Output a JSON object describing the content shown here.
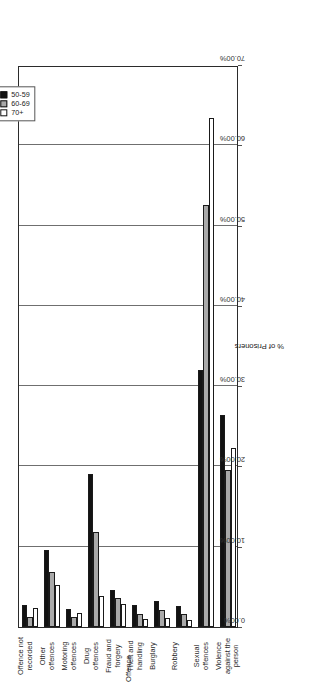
{
  "chart_data": {
    "type": "bar",
    "orientation": "horizontal",
    "title": "",
    "xlabel": "Offence",
    "ylabel": "% of Prisoners",
    "categories": [
      "Violence against the person",
      "Sexual offences",
      "Robbery",
      "Burglary",
      "Theft and handling",
      "Fraud and forgery",
      "Drug offences",
      "Motoring offences",
      "Other offences",
      "Offence not recorded"
    ],
    "category_labels": [
      "Violence\nagainst the\nperson",
      "Sexual\noffences",
      "Robbery",
      "Burglary",
      "Theft and\nhandling",
      "Fraud and\nforgery",
      "Drug\noffences",
      "Motoring\noffences",
      "Other\noffences",
      "Offence not\nrecorded"
    ],
    "series": [
      {
        "name": "50-59",
        "color": "#121212",
        "values": [
          26.4,
          32.0,
          2.6,
          3.2,
          2.7,
          4.6,
          19.0,
          2.2,
          9.6,
          2.8
        ]
      },
      {
        "name": "60-69",
        "color": "#a9a9a9",
        "values": [
          19.6,
          52.6,
          1.6,
          2.1,
          1.6,
          3.6,
          11.8,
          1.3,
          6.9,
          1.2
        ]
      },
      {
        "name": "70+",
        "color": "#ffffff",
        "values": [
          22.3,
          63.4,
          0.9,
          1.1,
          1.0,
          2.9,
          3.9,
          1.7,
          5.2,
          2.4
        ]
      }
    ],
    "ticks": [
      "70.00%",
      "60.00%",
      "50.00%",
      "40.00%",
      "30.00%",
      "20.00%",
      "10.00%",
      "0.00%"
    ],
    "tick_values": [
      70,
      60,
      50,
      40,
      30,
      20,
      10,
      0
    ],
    "xlim": [
      0,
      70
    ],
    "grid": true,
    "legend_position": "top-left-outside"
  },
  "legend": {
    "entries": [
      {
        "label": "50-59",
        "color": "#121212"
      },
      {
        "label": "60-69",
        "color": "#a9a9a9"
      },
      {
        "label": "70+",
        "color": "#ffffff"
      }
    ]
  },
  "axis": {
    "value_axis_title": "% of Prisoners",
    "category_axis_title": "Offence"
  }
}
